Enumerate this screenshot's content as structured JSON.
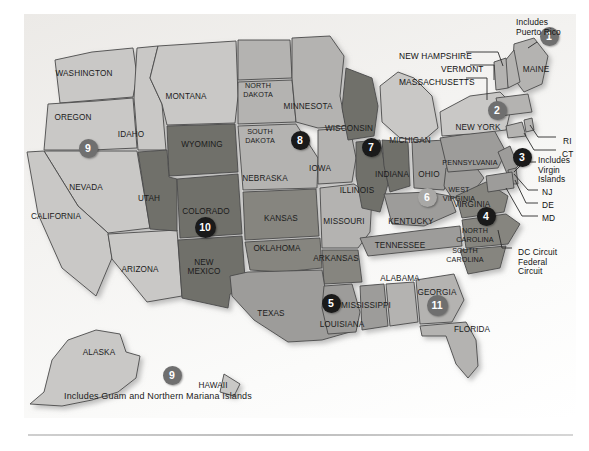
{
  "map": {
    "title": "United States Federal Judicial Circuits",
    "background_color": "#f1f0ee",
    "border_color": "#c6c6c6",
    "footnote": "Includes Guam and Northern Mariana Islands"
  },
  "callouts": [
    {
      "name": "includes-puerto-rico",
      "text": "Includes\nPuerto Rico",
      "x": 516,
      "y": 18
    },
    {
      "name": "new-hampshire",
      "text": "NEW HAMPSHIRE",
      "x": 399,
      "y": 52
    },
    {
      "name": "vermont",
      "text": "VERMONT",
      "x": 441,
      "y": 65
    },
    {
      "name": "massachusetts",
      "text": "MASSACHUSETTS",
      "x": 399,
      "y": 78
    },
    {
      "name": "rhode-island",
      "text": "RI",
      "x": 563,
      "y": 137
    },
    {
      "name": "connecticut",
      "text": "CT",
      "x": 562,
      "y": 150
    },
    {
      "name": "includes-virgin-islands",
      "text": "Includes\nVirgin\nIslands",
      "x": 538,
      "y": 156
    },
    {
      "name": "new-jersey",
      "text": "NJ",
      "x": 542,
      "y": 188
    },
    {
      "name": "delaware",
      "text": "DE",
      "x": 542,
      "y": 201
    },
    {
      "name": "maryland",
      "text": "MD",
      "x": 542,
      "y": 214
    },
    {
      "name": "dc-federal-circuit",
      "text": "DC Circuit\nFederal\nCircuit",
      "x": 518,
      "y": 248
    }
  ],
  "states": [
    {
      "label": "WASHINGTON",
      "x": 84,
      "y": 76,
      "circuit": 9
    },
    {
      "label": "OREGON",
      "x": 73,
      "y": 120,
      "circuit": 9
    },
    {
      "label": "IDAHO",
      "x": 131,
      "y": 137,
      "circuit": 9
    },
    {
      "label": "MONTANA",
      "x": 186,
      "y": 99,
      "circuit": 9
    },
    {
      "label": "NEVADA",
      "x": 86,
      "y": 190,
      "circuit": 9
    },
    {
      "label": "CALIFORNIA",
      "x": 56,
      "y": 219,
      "circuit": 9
    },
    {
      "label": "ARIZONA",
      "x": 140,
      "y": 272,
      "circuit": 9
    },
    {
      "label": "UTAH",
      "x": 149,
      "y": 201,
      "circuit": 10
    },
    {
      "label": "WYOMING",
      "x": 202,
      "y": 147,
      "circuit": 10
    },
    {
      "label": "COLORADO",
      "x": 206,
      "y": 214,
      "circuit": 10
    },
    {
      "label": "NEW MEXICO",
      "x": 204,
      "y": 269,
      "circuit": 10
    },
    {
      "label": "KANSAS",
      "x": 281,
      "y": 221,
      "circuit": 10
    },
    {
      "label": "OKLAHOMA",
      "x": 277,
      "y": 251,
      "circuit": 10
    },
    {
      "label": "NORTH DAKOTA",
      "x": 258,
      "y": 92,
      "circuit": 8
    },
    {
      "label": "SOUTH DAKOTA",
      "x": 260,
      "y": 138,
      "circuit": 8
    },
    {
      "label": "NEBRASKA",
      "x": 265,
      "y": 181,
      "circuit": 8
    },
    {
      "label": "MINNESOTA",
      "x": 308,
      "y": 109,
      "circuit": 8
    },
    {
      "label": "IOWA",
      "x": 320,
      "y": 171,
      "circuit": 8
    },
    {
      "label": "MISSOURI",
      "x": 344,
      "y": 224,
      "circuit": 8
    },
    {
      "label": "ARKANSAS",
      "x": 336,
      "y": 261,
      "circuit": 8
    },
    {
      "label": "WISCONSIN",
      "x": 349,
      "y": 131,
      "circuit": 7
    },
    {
      "label": "ILLINOIS",
      "x": 357,
      "y": 193,
      "circuit": 7
    },
    {
      "label": "INDIANA",
      "x": 392,
      "y": 177,
      "circuit": 7
    },
    {
      "label": "MICHIGAN",
      "x": 410,
      "y": 143,
      "circuit": 6
    },
    {
      "label": "OHIO",
      "x": 429,
      "y": 177,
      "circuit": 6
    },
    {
      "label": "KENTUCKY",
      "x": 411,
      "y": 224,
      "circuit": 6
    },
    {
      "label": "TENNESSEE",
      "x": 400,
      "y": 248,
      "circuit": 6
    },
    {
      "label": "TEXAS",
      "x": 271,
      "y": 316,
      "circuit": 5
    },
    {
      "label": "LOUISIANA",
      "x": 342,
      "y": 327,
      "circuit": 5
    },
    {
      "label": "MISSISSIPPI",
      "x": 366,
      "y": 308,
      "circuit": 5
    },
    {
      "label": "ALABAMA",
      "x": 400,
      "y": 281,
      "circuit": 11
    },
    {
      "label": "GEORGIA",
      "x": 437,
      "y": 295,
      "circuit": 11
    },
    {
      "label": "FLORIDA",
      "x": 472,
      "y": 332,
      "circuit": 11
    },
    {
      "label": "WEST VIRGINIA",
      "x": 459,
      "y": 196,
      "circuit": 4
    },
    {
      "label": "VIRGINIA",
      "x": 472,
      "y": 207,
      "circuit": 4
    },
    {
      "label": "NORTH CAROLINA",
      "x": 475,
      "y": 237,
      "circuit": 4
    },
    {
      "label": "SOUTH CAROLINA",
      "x": 465,
      "y": 257,
      "circuit": 4
    },
    {
      "label": "PENNSYLVANIA",
      "x": 470,
      "y": 165,
      "circuit": 3
    },
    {
      "label": "NEW YORK",
      "x": 478,
      "y": 130,
      "circuit": 2
    },
    {
      "label": "MAINE",
      "x": 536,
      "y": 72,
      "circuit": 1
    },
    {
      "label": "ALASKA",
      "x": 99,
      "y": 355,
      "circuit": 9
    },
    {
      "label": "HAWAII",
      "x": 213,
      "y": 388,
      "circuit": 9
    }
  ],
  "circuit_badges": [
    {
      "number": "1",
      "x": 549,
      "y": 36,
      "shade": "b-mid"
    },
    {
      "number": "2",
      "x": 497,
      "y": 110,
      "shade": "b-mid"
    },
    {
      "number": "3",
      "x": 522,
      "y": 157,
      "shade": "b-dark"
    },
    {
      "number": "4",
      "x": 486,
      "y": 216,
      "shade": "b-dark"
    },
    {
      "number": "5",
      "x": 331,
      "y": 303,
      "shade": "b-dark"
    },
    {
      "number": "6",
      "x": 427,
      "y": 197,
      "shade": "b-light"
    },
    {
      "number": "7",
      "x": 371,
      "y": 147,
      "shade": "b-dark"
    },
    {
      "number": "8",
      "x": 300,
      "y": 140,
      "shade": "b-dark"
    },
    {
      "number": "9",
      "x": 88,
      "y": 148,
      "shade": "b-mid"
    },
    {
      "number": "10",
      "x": 205,
      "y": 227,
      "shade": "b-dark"
    },
    {
      "number": "11",
      "x": 437,
      "y": 305,
      "shade": "b-mid"
    },
    {
      "number": "9",
      "x": 172,
      "y": 375,
      "shade": "b-mid"
    }
  ]
}
